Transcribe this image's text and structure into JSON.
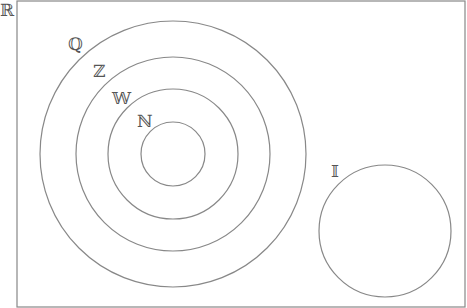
{
  "diagram": {
    "universe": {
      "label": "ℝ",
      "x": 17,
      "y": 1,
      "width": 448,
      "height": 306
    },
    "stroke_color": "#888888",
    "label_color": "#555555",
    "circles": [
      {
        "id": "Q",
        "label": "ℚ",
        "cx": 173,
        "cy": 154,
        "r": 133,
        "label_x": 68,
        "label_y": 36
      },
      {
        "id": "Z",
        "label": "ℤ",
        "cx": 173,
        "cy": 154,
        "r": 97,
        "label_x": 93,
        "label_y": 63
      },
      {
        "id": "W",
        "label": "𝕎",
        "cx": 173,
        "cy": 154,
        "r": 65,
        "label_x": 112,
        "label_y": 90
      },
      {
        "id": "N",
        "label": "ℕ",
        "cx": 173,
        "cy": 154,
        "r": 32,
        "label_x": 137,
        "label_y": 113
      },
      {
        "id": "I",
        "label": "𝕀",
        "cx": 385,
        "cy": 231,
        "r": 66,
        "label_x": 331,
        "label_y": 163
      }
    ]
  }
}
